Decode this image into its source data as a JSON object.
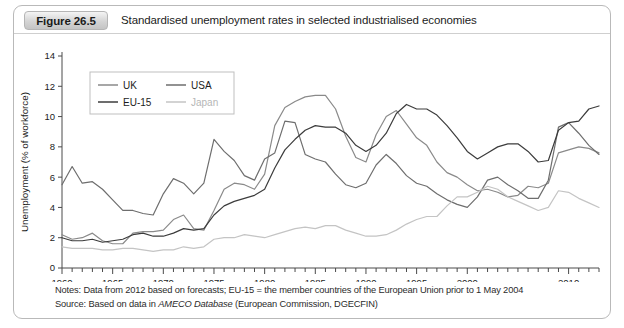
{
  "figure": {
    "badge": "Figure 26.5",
    "title": "Standardised unemployment rates in selected industrialised economies"
  },
  "notes": {
    "notes_prefix": "Notes: Data from 2012 based on forecasts; EU-15 = the member countries of the European Union prior to 1 May 2004",
    "source_prefix": "Source: Based on data in ",
    "source_italic": "AMECO Database",
    "source_suffix": " (European Commission, DGECFIN)"
  },
  "colors": {
    "uk": "#8a8a8a",
    "usa": "#6e6e6e",
    "eu15": "#3c3c3c",
    "japan": "#c4c4c4",
    "axis": "#4a4a4a",
    "border": "#b9b9b9"
  },
  "chart_data": {
    "type": "line",
    "title": "Standardised unemployment rates in selected industrialised economies",
    "xlabel": "",
    "ylabel": "Unemployment (% of workforce)",
    "xlim": [
      1960,
      2013
    ],
    "ylim": [
      0,
      14
    ],
    "ytick_step": 2,
    "yticks": [
      0,
      2,
      4,
      6,
      8,
      10,
      12,
      14
    ],
    "xticks": [
      1960,
      1965,
      1970,
      1975,
      1980,
      1985,
      1990,
      1995,
      2000,
      2010
    ],
    "xtick_labels": [
      "1960",
      "1965",
      "1970",
      "1975",
      "1980",
      "1985",
      "1990",
      "1995",
      "2000",
      "2010"
    ],
    "minor_tick_step": 1,
    "grid": false,
    "legend_position": "upper-left-inside",
    "x": [
      1960,
      1961,
      1962,
      1963,
      1964,
      1965,
      1966,
      1967,
      1968,
      1969,
      1970,
      1971,
      1972,
      1973,
      1974,
      1975,
      1976,
      1977,
      1978,
      1979,
      1980,
      1981,
      1982,
      1983,
      1984,
      1985,
      1986,
      1987,
      1988,
      1989,
      1990,
      1991,
      1992,
      1993,
      1994,
      1995,
      1996,
      1997,
      1998,
      1999,
      2000,
      2001,
      2002,
      2003,
      2004,
      2005,
      2006,
      2007,
      2008,
      2009,
      2010,
      2011,
      2012,
      2013
    ],
    "series": [
      {
        "name": "UK",
        "color": "#8a8a8a",
        "values": [
          2.2,
          1.9,
          2.0,
          2.3,
          1.8,
          1.6,
          1.6,
          2.3,
          2.4,
          2.4,
          2.5,
          3.2,
          3.5,
          2.6,
          2.5,
          3.8,
          5.2,
          5.6,
          5.5,
          5.2,
          6.2,
          9.4,
          10.6,
          11.0,
          11.3,
          11.4,
          11.4,
          10.5,
          8.7,
          7.3,
          7.0,
          8.8,
          10.0,
          10.4,
          9.5,
          8.6,
          8.1,
          7.0,
          6.3,
          6.0,
          5.5,
          5.1,
          5.2,
          5.0,
          4.7,
          4.8,
          5.4,
          5.3,
          5.6,
          7.6,
          7.8,
          8.0,
          7.9,
          7.6
        ]
      },
      {
        "name": "USA",
        "color": "#6e6e6e",
        "values": [
          5.5,
          6.7,
          5.6,
          5.7,
          5.2,
          4.5,
          3.8,
          3.8,
          3.6,
          3.5,
          4.9,
          5.9,
          5.6,
          4.9,
          5.6,
          8.5,
          7.7,
          7.1,
          6.1,
          5.8,
          7.2,
          7.6,
          9.7,
          9.6,
          7.5,
          7.2,
          7.0,
          6.2,
          5.5,
          5.3,
          5.6,
          6.8,
          7.5,
          6.9,
          6.1,
          5.6,
          5.4,
          4.9,
          4.5,
          4.2,
          4.0,
          4.7,
          5.8,
          6.0,
          5.5,
          5.1,
          4.6,
          4.6,
          5.8,
          9.3,
          9.6,
          8.9,
          8.1,
          7.5
        ]
      },
      {
        "name": "EU-15",
        "color": "#3c3c3c",
        "values": [
          2.0,
          1.8,
          1.8,
          1.9,
          1.7,
          1.8,
          1.9,
          2.2,
          2.3,
          2.1,
          2.1,
          2.3,
          2.6,
          2.5,
          2.6,
          3.5,
          4.1,
          4.4,
          4.6,
          4.8,
          5.2,
          6.6,
          7.8,
          8.5,
          9.1,
          9.4,
          9.3,
          9.3,
          8.9,
          8.1,
          7.7,
          8.1,
          8.9,
          10.2,
          10.8,
          10.5,
          10.5,
          10.1,
          9.4,
          8.6,
          7.7,
          7.2,
          7.6,
          8.0,
          8.2,
          8.2,
          7.7,
          7.0,
          7.1,
          9.1,
          9.6,
          9.7,
          10.5,
          10.7
        ]
      },
      {
        "name": "Japan",
        "color": "#c4c4c4",
        "values": [
          1.4,
          1.3,
          1.3,
          1.3,
          1.2,
          1.2,
          1.3,
          1.3,
          1.2,
          1.1,
          1.2,
          1.2,
          1.4,
          1.3,
          1.4,
          1.9,
          2.0,
          2.0,
          2.2,
          2.1,
          2.0,
          2.2,
          2.4,
          2.6,
          2.7,
          2.6,
          2.8,
          2.8,
          2.5,
          2.3,
          2.1,
          2.1,
          2.2,
          2.5,
          2.9,
          3.2,
          3.4,
          3.4,
          4.1,
          4.7,
          4.7,
          5.0,
          5.4,
          5.2,
          4.7,
          4.4,
          4.1,
          3.8,
          4.0,
          5.1,
          5.0,
          4.6,
          4.3,
          4.0
        ]
      }
    ],
    "legend": [
      {
        "name": "UK",
        "color": "#8a8a8a"
      },
      {
        "name": "USA",
        "color": "#6e6e6e"
      },
      {
        "name": "EU-15",
        "color": "#3c3c3c"
      },
      {
        "name": "Japan",
        "color": "#c4c4c4"
      }
    ]
  }
}
